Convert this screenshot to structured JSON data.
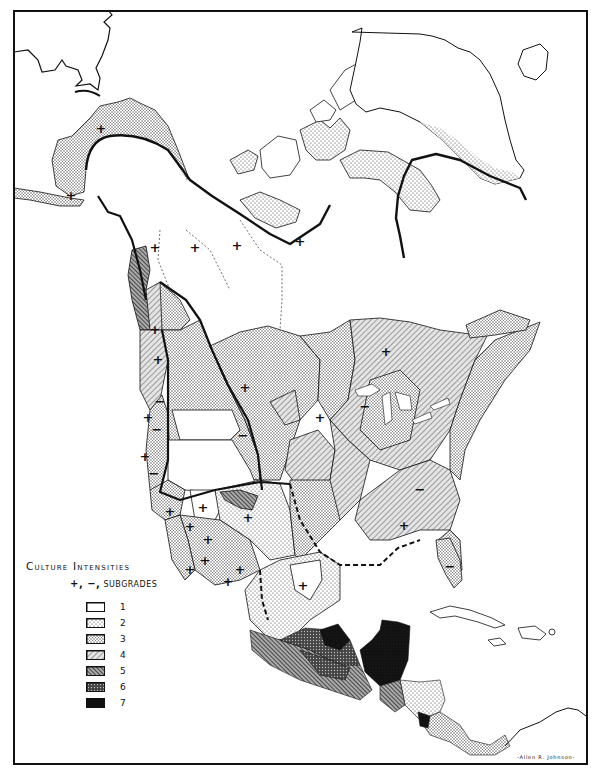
{
  "map": {
    "subject": "North America culture intensity map",
    "region_shown": "North America, Greenland, Central America, Caribbean",
    "signature": "-Allen R. Johnson-"
  },
  "legend": {
    "title": "Culture Intensities",
    "subgrades_symbols": "+, −,",
    "subgrades_label": "Subgrades",
    "items": [
      {
        "grade": "1",
        "pattern": "blank",
        "fill": "#ffffff"
      },
      {
        "grade": "2",
        "pattern": "sparse-dots",
        "fill": "#eeeeee"
      },
      {
        "grade": "3",
        "pattern": "dense-dots",
        "fill": "#d6d6d6"
      },
      {
        "grade": "4",
        "pattern": "light-hatch",
        "fill": "#bbbbbb"
      },
      {
        "grade": "5",
        "pattern": "heavy-hatch",
        "fill": "#888888"
      },
      {
        "grade": "6",
        "pattern": "crosshatch",
        "fill": "#555555"
      },
      {
        "grade": "7",
        "pattern": "solid",
        "fill": "#111111"
      }
    ]
  },
  "markers": {
    "plus": "+",
    "minus": "−"
  },
  "colors": {
    "ink": "#111111",
    "paper": "#ffffff"
  }
}
